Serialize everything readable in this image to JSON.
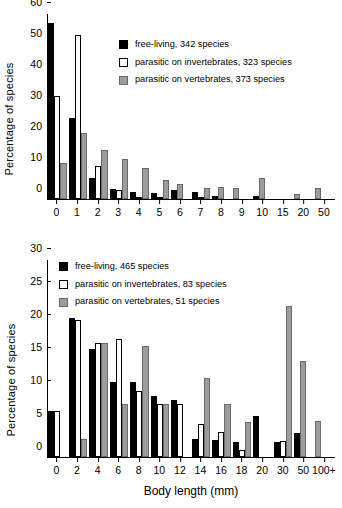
{
  "chart_data": [
    {
      "id": "top",
      "type": "bar",
      "title": "",
      "xlabel": "",
      "ylabel": "Percentage of species",
      "ylim": [
        0,
        60
      ],
      "yticks": [
        0,
        10,
        20,
        30,
        40,
        50,
        60
      ],
      "grid": false,
      "legend_position": "upper right inside",
      "categories": [
        "0",
        "1",
        "2",
        "3",
        "4",
        "5",
        "6",
        "7",
        "8",
        "9",
        "10",
        "15",
        "20",
        "50"
      ],
      "series": [
        {
          "name": "free-living, 342 species",
          "key": "free",
          "color": "#000000",
          "values": [
            57.0,
            26.2,
            6.9,
            3.4,
            2.4,
            1.9,
            2.9,
            2.2,
            1.1,
            0.0,
            0.9,
            0.0,
            0.0,
            0.0
          ]
        },
        {
          "name": "parasitic on invertebrates, 323 species",
          "key": "inv",
          "color": "#ffffff",
          "values": [
            33.3,
            53.1,
            10.7,
            2.9,
            0.5,
            0.5,
            0.0,
            0.5,
            0.0,
            0.0,
            0.0,
            0.0,
            0.0,
            0.0
          ]
        },
        {
          "name": "parasitic on vertebrates, 373 species",
          "key": "vert",
          "color": "#9c9c9c",
          "values": [
            11.8,
            21.4,
            16.0,
            12.9,
            10.1,
            6.2,
            4.8,
            3.5,
            4.0,
            3.7,
            6.9,
            0.0,
            1.5,
            3.5
          ]
        }
      ]
    },
    {
      "id": "bottom",
      "type": "bar",
      "title": "",
      "xlabel": "Body length (mm)",
      "ylabel": "Percentage of species",
      "ylim": [
        0,
        30
      ],
      "yticks": [
        0,
        5,
        10,
        15,
        20,
        25,
        30
      ],
      "grid": false,
      "legend_position": "upper left inside",
      "categories": [
        "0",
        "2",
        "4",
        "6",
        "8",
        "10",
        "12",
        "14",
        "16",
        "18",
        "20",
        "30",
        "50",
        "100+"
      ],
      "series": [
        {
          "name": "free-living, 465 species",
          "key": "free",
          "color": "#000000",
          "values": [
            7.0,
            21.2,
            16.4,
            11.4,
            11.4,
            9.3,
            8.7,
            2.7,
            2.6,
            2.3,
            6.2,
            2.3,
            3.6,
            0.0
          ]
        },
        {
          "name": "parasitic on invertebrates, 83 species",
          "key": "inv",
          "color": "#ffffff",
          "values": [
            7.0,
            20.9,
            17.3,
            18.0,
            10.1,
            8.1,
            8.1,
            5.0,
            3.8,
            1.0,
            0.0,
            2.4,
            0.0,
            0.0
          ]
        },
        {
          "name": "parasitic on vertebrates, 51 species",
          "key": "vert",
          "color": "#9c9c9c",
          "values": [
            0.0,
            2.7,
            17.3,
            8.1,
            16.9,
            8.1,
            0.0,
            12.0,
            8.1,
            5.4,
            0.0,
            23.0,
            14.6,
            5.5
          ]
        }
      ]
    }
  ],
  "panels": {
    "top": {
      "ylabel": "Percentage of species",
      "yticks": [
        "0",
        "10",
        "20",
        "30",
        "40",
        "50",
        "60"
      ],
      "xticks": [
        "0",
        "1",
        "2",
        "3",
        "4",
        "5",
        "6",
        "7",
        "8",
        "9",
        "10",
        "15",
        "20",
        "50"
      ],
      "legend": [
        {
          "label": "free-living, 342 species",
          "swatch": "swatch-black"
        },
        {
          "label": "parasitic on invertebrates, 323 species",
          "swatch": "swatch-white"
        },
        {
          "label": "parasitic on vertebrates, 373 species",
          "swatch": "swatch-gray"
        }
      ]
    },
    "bottom": {
      "ylabel": "Percentage of species",
      "xlabel": "Body length (mm)",
      "yticks": [
        "0",
        "5",
        "10",
        "15",
        "20",
        "25",
        "30"
      ],
      "xticks": [
        "0",
        "2",
        "4",
        "6",
        "8",
        "10",
        "12",
        "14",
        "16",
        "18",
        "20",
        "30",
        "50",
        "100+"
      ],
      "legend": [
        {
          "label": "free-living, 465 species",
          "swatch": "swatch-black"
        },
        {
          "label": "parasitic on invertebrates, 83 species",
          "swatch": "swatch-white"
        },
        {
          "label": "parasitic on vertebrates, 51 species",
          "swatch": "swatch-gray"
        }
      ]
    }
  },
  "colors": {
    "free_living": "#000000",
    "parasitic_invertebrates": "#ffffff",
    "parasitic_vertebrates": "#9c9c9c",
    "axis": "#000000"
  }
}
